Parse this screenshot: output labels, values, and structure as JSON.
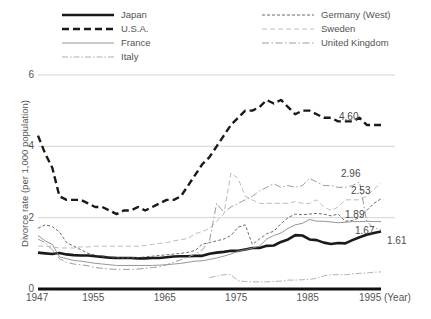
{
  "chart_data": {
    "type": "line",
    "title": "",
    "xlabel": "1995 (Year)",
    "ylabel": "Divorce rate (per 1,000 population)",
    "xlim": [
      1947,
      1995
    ],
    "ylim": [
      0,
      6
    ],
    "yticks": [
      0,
      2,
      4,
      6
    ],
    "xticks": [
      1947,
      1955,
      1965,
      1975,
      1985,
      1995
    ],
    "xtick_labels": [
      "1947",
      "1955",
      "1965",
      "1975",
      "1985",
      "1995 (Year)"
    ],
    "ytick_labels": [
      "0",
      "2",
      "4",
      "6"
    ],
    "grid": "horizontal",
    "legend_position": "top",
    "x": [
      1947,
      1948,
      1949,
      1950,
      1951,
      1952,
      1953,
      1954,
      1955,
      1956,
      1957,
      1958,
      1959,
      1960,
      1961,
      1962,
      1963,
      1964,
      1965,
      1966,
      1967,
      1968,
      1969,
      1970,
      1971,
      1972,
      1973,
      1974,
      1975,
      1976,
      1977,
      1978,
      1979,
      1980,
      1981,
      1982,
      1983,
      1984,
      1985,
      1986,
      1987,
      1988,
      1989,
      1990,
      1991,
      1992,
      1993,
      1994,
      1995
    ],
    "series": [
      {
        "name": "Japan",
        "style": "solid-thick",
        "color": "#1a1a1a",
        "end_value": 1.61,
        "end_label": "1.61",
        "values": [
          1.02,
          1.0,
          0.98,
          1.01,
          0.97,
          0.95,
          0.94,
          0.94,
          0.92,
          0.9,
          0.88,
          0.87,
          0.87,
          0.87,
          0.86,
          0.86,
          0.87,
          0.87,
          0.89,
          0.91,
          0.92,
          0.92,
          0.93,
          0.93,
          0.99,
          1.02,
          1.04,
          1.07,
          1.07,
          1.11,
          1.15,
          1.15,
          1.21,
          1.22,
          1.32,
          1.39,
          1.51,
          1.5,
          1.39,
          1.37,
          1.3,
          1.26,
          1.29,
          1.28,
          1.37,
          1.45,
          1.52,
          1.57,
          1.61
        ]
      },
      {
        "name": "U.S.A.",
        "style": "dashed-thick",
        "color": "#1a1a1a",
        "end_value": 4.6,
        "end_label": "4.60",
        "values": [
          4.3,
          3.8,
          3.4,
          2.6,
          2.5,
          2.5,
          2.5,
          2.4,
          2.3,
          2.3,
          2.2,
          2.1,
          2.2,
          2.2,
          2.3,
          2.2,
          2.3,
          2.4,
          2.5,
          2.5,
          2.6,
          2.9,
          3.2,
          3.5,
          3.7,
          4.0,
          4.3,
          4.6,
          4.8,
          5.0,
          5.0,
          5.1,
          5.3,
          5.2,
          5.3,
          5.1,
          4.9,
          5.0,
          5.0,
          4.9,
          4.8,
          4.8,
          4.7,
          4.7,
          4.7,
          4.8,
          4.6,
          4.6,
          4.6
        ]
      },
      {
        "name": "France",
        "style": "solid-thin",
        "color": "#8a8a8a",
        "end_value": 1.89,
        "end_label": "1.89",
        "values": [
          1.5,
          1.35,
          1.25,
          0.9,
          0.85,
          0.8,
          0.78,
          0.75,
          0.72,
          0.7,
          0.68,
          0.66,
          0.66,
          0.66,
          0.66,
          0.66,
          0.66,
          0.67,
          0.68,
          0.7,
          0.72,
          0.75,
          0.78,
          0.79,
          0.83,
          0.87,
          0.92,
          0.98,
          1.06,
          1.1,
          1.15,
          1.2,
          1.4,
          1.5,
          1.57,
          1.7,
          1.8,
          1.84,
          1.95,
          1.9,
          1.9,
          1.88,
          1.86,
          1.87,
          1.89,
          1.89,
          1.9,
          1.89,
          1.89
        ]
      },
      {
        "name": "Italy",
        "style": "dashdot-thin",
        "color": "#a8a8a8",
        "end_value": 0.48,
        "end_label": "",
        "values": [
          0.0,
          0.0,
          0.0,
          0.0,
          0.0,
          0.0,
          0.0,
          0.0,
          0.0,
          0.0,
          0.0,
          0.0,
          0.0,
          0.0,
          0.0,
          0.0,
          0.0,
          0.0,
          0.0,
          0.0,
          0.0,
          0.0,
          0.0,
          0.0,
          0.32,
          0.36,
          0.4,
          0.4,
          0.23,
          0.21,
          0.2,
          0.2,
          0.2,
          0.21,
          0.22,
          0.25,
          0.25,
          0.26,
          0.27,
          0.3,
          0.37,
          0.4,
          0.4,
          0.4,
          0.42,
          0.44,
          0.45,
          0.47,
          0.48
        ]
      },
      {
        "name": "Germany (West)",
        "style": "dotted-dash",
        "color": "#5a5a5a",
        "end_value": 2.53,
        "end_label": "2.53",
        "values": [
          1.7,
          1.8,
          1.75,
          1.6,
          1.3,
          1.2,
          1.1,
          1.0,
          0.95,
          0.92,
          0.9,
          0.88,
          0.87,
          0.88,
          0.88,
          0.9,
          0.92,
          0.94,
          0.96,
          0.98,
          1.0,
          1.03,
          1.08,
          1.26,
          1.3,
          1.35,
          1.4,
          1.5,
          1.73,
          1.8,
          1.25,
          1.4,
          1.55,
          1.62,
          1.83,
          2.0,
          2.1,
          2.08,
          2.1,
          2.12,
          2.1,
          2.05,
          2.1,
          1.9,
          1.92,
          2.0,
          2.2,
          2.4,
          2.53
        ]
      },
      {
        "name": "Sweden",
        "style": "dashed-light",
        "color": "#b4b4b4",
        "end_value": 2.96,
        "end_label": "2.96",
        "values": [
          1.2,
          1.2,
          1.18,
          1.15,
          1.15,
          1.15,
          1.18,
          1.18,
          1.2,
          1.2,
          1.2,
          1.2,
          1.2,
          1.2,
          1.2,
          1.22,
          1.25,
          1.28,
          1.3,
          1.35,
          1.38,
          1.42,
          1.55,
          1.61,
          1.7,
          1.9,
          2.1,
          3.25,
          3.1,
          2.6,
          2.5,
          2.4,
          2.4,
          2.4,
          2.4,
          2.4,
          2.45,
          2.4,
          2.4,
          2.5,
          2.3,
          2.2,
          2.3,
          2.5,
          2.5,
          2.5,
          2.6,
          2.8,
          2.96
        ]
      },
      {
        "name": "United Kingdom",
        "style": "dashdot-mid",
        "color": "#9c9c9c",
        "end_value": 1.67,
        "end_label": "1.67",
        "values": [
          1.4,
          1.3,
          1.1,
          0.85,
          0.75,
          0.7,
          0.68,
          0.65,
          0.6,
          0.58,
          0.56,
          0.55,
          0.55,
          0.55,
          0.56,
          0.58,
          0.6,
          0.62,
          0.68,
          0.75,
          0.82,
          0.9,
          0.98,
          1.1,
          1.35,
          2.4,
          2.15,
          2.3,
          2.4,
          2.5,
          2.6,
          2.75,
          2.85,
          2.95,
          2.85,
          2.9,
          2.85,
          2.9,
          3.1,
          3.0,
          2.9,
          2.9,
          2.85,
          2.85,
          2.9,
          3.0,
          1.9,
          1.7,
          1.67
        ]
      }
    ]
  },
  "legend": {
    "left_column": [
      {
        "label": "Japan",
        "style": "solid-thick"
      },
      {
        "label": "U.S.A.",
        "style": "dashed-thick"
      },
      {
        "label": "France",
        "style": "solid-thin"
      },
      {
        "label": "Italy",
        "style": "dashdot-thin"
      }
    ],
    "right_column": [
      {
        "label": "Germany (West)",
        "style": "dotted-dash"
      },
      {
        "label": "Sweden",
        "style": "dashed-light"
      },
      {
        "label": "United Kingdom",
        "style": "dashdot-mid"
      }
    ]
  }
}
